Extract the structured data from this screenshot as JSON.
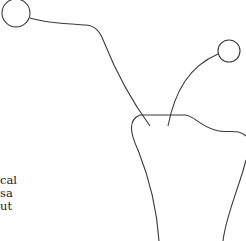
{
  "diagram": {
    "type": "tooth-outline-with-callouts",
    "stroke_color": "#3a3a3a",
    "background": "#ffffff",
    "callouts": [
      {
        "id": "callout-left",
        "marker": "circle",
        "cx": 16,
        "cy": 13,
        "r": 14
      },
      {
        "id": "callout-right",
        "marker": "circle",
        "cx": 229,
        "cy": 51,
        "r": 11
      }
    ],
    "text_fragments": [
      "cal",
      "sa",
      "ut"
    ]
  }
}
